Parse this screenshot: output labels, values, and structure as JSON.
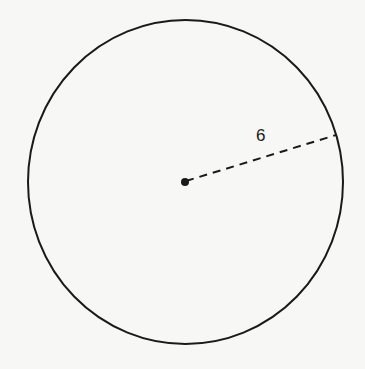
{
  "diagram": {
    "shape": "circle",
    "radius_label": "6",
    "elements": [
      {
        "type": "circle",
        "description": "circle outline"
      },
      {
        "type": "point",
        "description": "center point"
      },
      {
        "type": "dashed-segment",
        "description": "radius from center to circle edge",
        "label": "6"
      }
    ]
  }
}
